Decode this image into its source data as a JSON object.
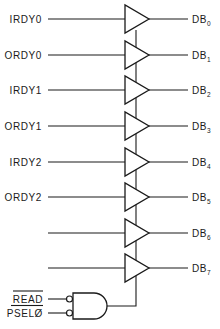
{
  "diagram": {
    "type": "circuit-schematic",
    "buffers": [
      {
        "input": "IRDY0",
        "output_base": "DB",
        "output_sub": "0"
      },
      {
        "input": "ORDY0",
        "output_base": "DB",
        "output_sub": "1"
      },
      {
        "input": "IRDY1",
        "output_base": "DB",
        "output_sub": "2"
      },
      {
        "input": "ORDY1",
        "output_base": "DB",
        "output_sub": "3"
      },
      {
        "input": "IRDY2",
        "output_base": "DB",
        "output_sub": "4"
      },
      {
        "input": "ORDY2",
        "output_base": "DB",
        "output_sub": "5"
      },
      {
        "input": "",
        "output_base": "DB",
        "output_sub": "6"
      },
      {
        "input": "",
        "output_base": "DB",
        "output_sub": "7"
      }
    ],
    "enable_gate": {
      "type": "AND (active-low inputs)",
      "inputs": [
        {
          "label": "READ",
          "active_low": true
        },
        {
          "label": "PSELØ",
          "active_low": true
        }
      ]
    },
    "colors": {
      "ink": "#1a1a1a",
      "background": "#ffffff"
    }
  }
}
